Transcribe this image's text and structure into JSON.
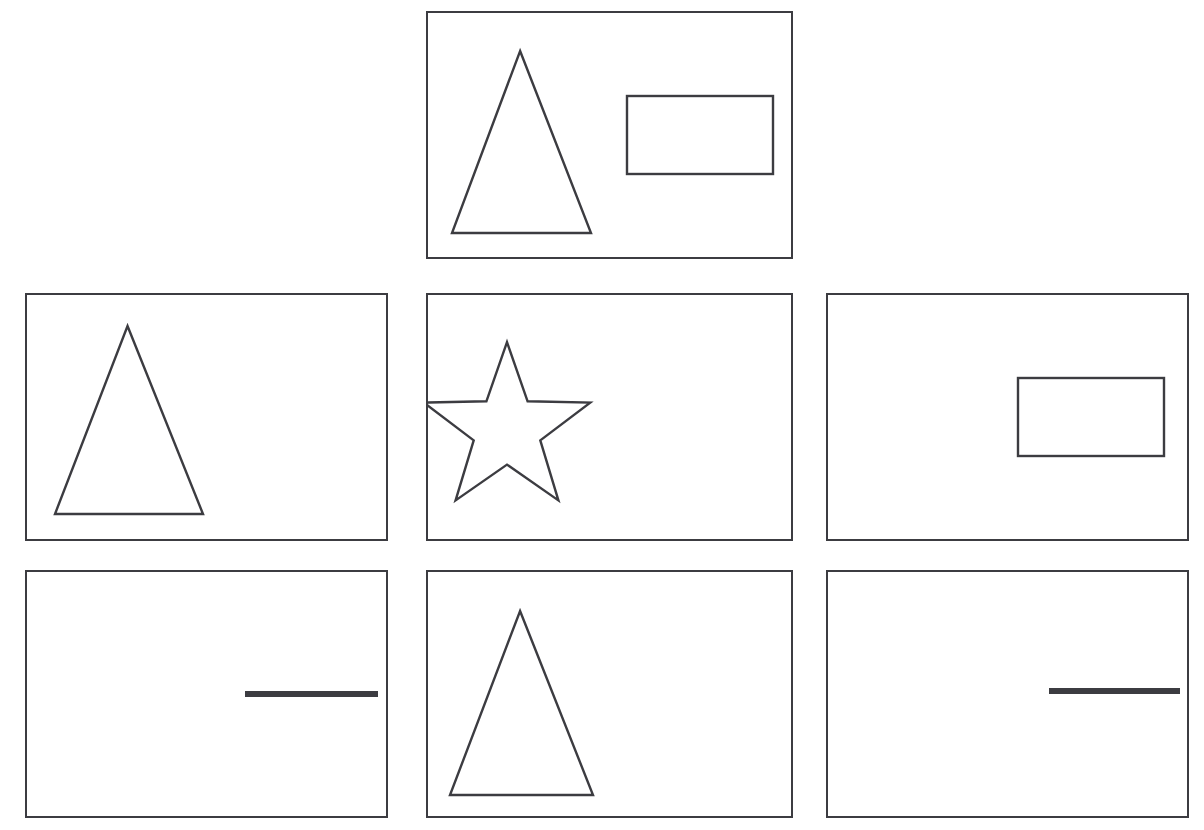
{
  "canvas": {
    "width": 1204,
    "height": 830,
    "background_color": "#ffffff",
    "stroke_color": "#3c3c41",
    "fill_color": "#ffffff"
  },
  "layout": {
    "description": "grid-of-shape-panels",
    "rows": 3,
    "columns": 3,
    "top_row_occupied_columns": [
      "center"
    ],
    "panel_width": 364,
    "panel_height": 248
  },
  "panels": [
    {
      "id": "panel-top-center",
      "position": "top-center",
      "row": 0,
      "column": 1,
      "x": 426,
      "y": 11,
      "width": 367,
      "height": 248,
      "shape_count": 2,
      "shapes": [
        {
          "name": "triangle",
          "kind": "triangle",
          "style": "outline",
          "x": 450,
          "y": 49,
          "width": 139,
          "height": 182,
          "position_in_panel": "left"
        },
        {
          "name": "rectangle",
          "kind": "rectangle",
          "style": "outline",
          "x": 625,
          "y": 94,
          "width": 146,
          "height": 78,
          "position_in_panel": "right"
        }
      ]
    },
    {
      "id": "panel-middle-left",
      "position": "middle-left",
      "row": 1,
      "column": 0,
      "x": 25,
      "y": 293,
      "width": 363,
      "height": 248,
      "shape_count": 1,
      "shapes": [
        {
          "name": "triangle",
          "kind": "triangle",
          "style": "outline",
          "x": 53,
          "y": 324,
          "width": 148,
          "height": 188,
          "position_in_panel": "left"
        }
      ]
    },
    {
      "id": "panel-middle-center",
      "position": "middle-center",
      "row": 1,
      "column": 1,
      "x": 426,
      "y": 293,
      "width": 367,
      "height": 248,
      "shape_count": 1,
      "shapes": [
        {
          "name": "star",
          "kind": "star",
          "points": 5,
          "style": "outline",
          "x": 434,
          "y": 341,
          "width": 142,
          "height": 165,
          "position_in_panel": "left"
        }
      ]
    },
    {
      "id": "panel-middle-right",
      "position": "middle-right",
      "row": 1,
      "column": 2,
      "x": 826,
      "y": 293,
      "width": 363,
      "height": 248,
      "shape_count": 1,
      "shapes": [
        {
          "name": "rectangle",
          "kind": "rectangle",
          "style": "outline",
          "x": 1016,
          "y": 376,
          "width": 146,
          "height": 78,
          "position_in_panel": "right"
        }
      ]
    },
    {
      "id": "panel-bottom-left",
      "position": "bottom-left",
      "row": 2,
      "column": 0,
      "x": 25,
      "y": 570,
      "width": 363,
      "height": 248,
      "shape_count": 1,
      "shapes": [
        {
          "name": "horizontal-line",
          "kind": "line",
          "style": "solid-bar",
          "x": 243,
          "y": 689,
          "width": 133,
          "height": 6,
          "position_in_panel": "right"
        }
      ]
    },
    {
      "id": "panel-bottom-center",
      "position": "bottom-center",
      "row": 2,
      "column": 1,
      "x": 426,
      "y": 570,
      "width": 367,
      "height": 248,
      "shape_count": 1,
      "shapes": [
        {
          "name": "triangle",
          "kind": "triangle",
          "style": "outline",
          "x": 448,
          "y": 609,
          "width": 143,
          "height": 184,
          "position_in_panel": "left"
        }
      ]
    },
    {
      "id": "panel-bottom-right",
      "position": "bottom-right",
      "row": 2,
      "column": 2,
      "x": 826,
      "y": 570,
      "width": 363,
      "height": 248,
      "shape_count": 1,
      "shapes": [
        {
          "name": "horizontal-line",
          "kind": "line",
          "style": "solid-bar",
          "x": 1047,
          "y": 686,
          "width": 131,
          "height": 6,
          "position_in_panel": "right"
        }
      ]
    }
  ]
}
